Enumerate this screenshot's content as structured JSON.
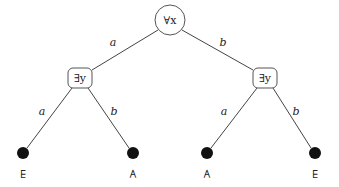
{
  "diagram": {
    "type": "game-tree",
    "root": {
      "label": "∀x",
      "shape": "circle",
      "cx": 170,
      "cy": 20,
      "r": 15
    },
    "internal": [
      {
        "label": "∃y",
        "shape": "rounded-rect",
        "cx": 80,
        "cy": 78
      },
      {
        "label": "∃y",
        "shape": "rounded-rect",
        "cx": 265,
        "cy": 78
      }
    ],
    "edges": [
      {
        "from": "root",
        "to": "left",
        "label": "a"
      },
      {
        "from": "root",
        "to": "right",
        "label": "b"
      },
      {
        "from": "left",
        "to": "leaf1",
        "label": "a"
      },
      {
        "from": "left",
        "to": "leaf2",
        "label": "b"
      },
      {
        "from": "right",
        "to": "leaf3",
        "label": "a"
      },
      {
        "from": "right",
        "to": "leaf4",
        "label": "b"
      }
    ],
    "leaves": [
      {
        "label": "∃",
        "cx": 23,
        "cy": 153
      },
      {
        "label": "∀",
        "cx": 133,
        "cy": 153
      },
      {
        "label": "∀",
        "cx": 207,
        "cy": 153
      },
      {
        "label": "∃",
        "cx": 315,
        "cy": 153
      }
    ]
  }
}
